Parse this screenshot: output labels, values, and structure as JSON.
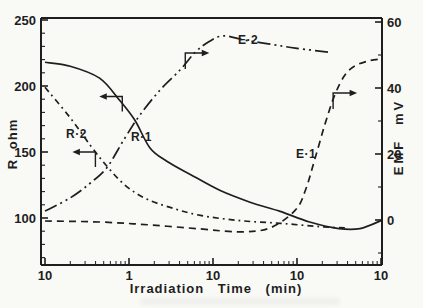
{
  "figure": {
    "background_color": "#f9f9f6",
    "ink_color": "#1e1e1e"
  },
  "chart_data": {
    "type": "line",
    "title": "",
    "x_axis": {
      "label": "Irradiation Time (min)",
      "scale": "log",
      "tick_labels": [
        "10",
        "1",
        "10",
        "10",
        "10"
      ],
      "decades": 4,
      "minor_ticks": "log-spaced 2-9 per decade"
    },
    "y_axis_left": {
      "label": "R ohm",
      "tick_labels": [
        "250",
        "200",
        "150",
        "100"
      ],
      "ticks": [
        250,
        200,
        150,
        100
      ],
      "minor_tick_step": 10,
      "ylim": [
        65,
        252
      ]
    },
    "y_axis_right": {
      "label": "EMF mV",
      "tick_labels": [
        "60",
        "40",
        "20",
        "0"
      ],
      "ticks": [
        60,
        40,
        20,
        0
      ],
      "minor_tick_step": 10,
      "ylim": [
        -13.6,
        61
      ]
    },
    "series": [
      {
        "name": "R·1",
        "axis": "left",
        "style": "solid",
        "points": [
          [
            0,
            218
          ],
          [
            0.3,
            215
          ],
          [
            0.65,
            206
          ],
          [
            0.89,
            189
          ],
          [
            1.07,
            174
          ],
          [
            1.25,
            153
          ],
          [
            1.45,
            143
          ],
          [
            1.73,
            133
          ],
          [
            2.08,
            121
          ],
          [
            2.44,
            112
          ],
          [
            2.8,
            105
          ],
          [
            3.15,
            97
          ],
          [
            3.5,
            92
          ],
          [
            3.75,
            92
          ],
          [
            4,
            98
          ]
        ]
      },
      {
        "name": "R·2",
        "axis": "left",
        "style": "dash-dot",
        "points": [
          [
            0,
            199
          ],
          [
            0.3,
            176
          ],
          [
            0.54,
            155
          ],
          [
            0.74,
            139
          ],
          [
            0.95,
            125
          ],
          [
            1.19,
            115
          ],
          [
            1.49,
            108
          ],
          [
            1.85,
            102
          ],
          [
            2.32,
            98
          ],
          [
            2.8,
            96
          ],
          [
            3.27,
            93.5
          ],
          [
            3.57,
            92.5
          ]
        ]
      },
      {
        "name": "E·2",
        "axis": "right",
        "style": "dash-dot-dot",
        "points": [
          [
            0,
            2.7
          ],
          [
            0.3,
            6.7
          ],
          [
            0.54,
            11.2
          ],
          [
            0.74,
            16
          ],
          [
            0.95,
            24.8
          ],
          [
            1.13,
            31.8
          ],
          [
            1.37,
            39.4
          ],
          [
            1.61,
            45.5
          ],
          [
            1.79,
            50.9
          ],
          [
            1.95,
            54
          ],
          [
            2.12,
            55.8
          ],
          [
            2.38,
            54.5
          ],
          [
            2.68,
            53.3
          ],
          [
            2.98,
            52.1
          ],
          [
            3.39,
            50.8
          ]
        ]
      },
      {
        "name": "E·1",
        "axis": "right",
        "style": "dashed",
        "points": [
          [
            0,
            -0.3
          ],
          [
            0.65,
            -0.6
          ],
          [
            1.25,
            -1.5
          ],
          [
            1.85,
            -2.7
          ],
          [
            2.32,
            -3.6
          ],
          [
            2.68,
            -2.4
          ],
          [
            2.98,
            3
          ],
          [
            3.1,
            9
          ],
          [
            3.21,
            18.2
          ],
          [
            3.33,
            28.8
          ],
          [
            3.45,
            37.9
          ],
          [
            3.57,
            43.9
          ],
          [
            3.69,
            46.7
          ],
          [
            3.85,
            48.2
          ],
          [
            4,
            48.8
          ]
        ]
      }
    ],
    "axis_markers": [
      {
        "for": "R·2",
        "arrow": "left",
        "axis": "left",
        "x": 0.6,
        "y": 150
      },
      {
        "for": "R·1",
        "arrow": "left",
        "axis": "left",
        "x": 0.92,
        "y": 192
      },
      {
        "for": "E·2",
        "arrow": "right",
        "axis": "right",
        "x": 1.67,
        "y": 50.6
      },
      {
        "for": "E·1",
        "arrow": "right",
        "axis": "right",
        "x": 3.43,
        "y": 38.5
      }
    ],
    "legend_position": "none",
    "grid": false
  }
}
